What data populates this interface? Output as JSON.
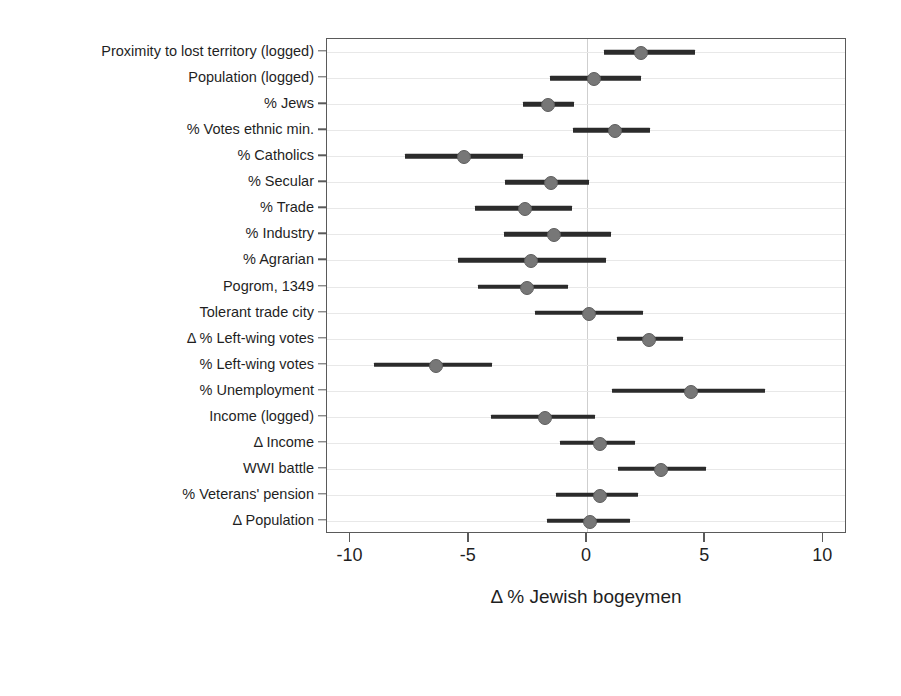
{
  "chart_data": {
    "type": "scatter",
    "subtype": "coefficient-forest-plot",
    "title": "",
    "xlabel": "Δ % Jewish bogeymen",
    "ylabel": "",
    "xlim": [
      -11,
      11
    ],
    "xticks": [
      -10,
      -5,
      0,
      5,
      10
    ],
    "xticklabels": [
      "-10",
      "-5",
      "0",
      "5",
      "10"
    ],
    "grid": "horizontal-light",
    "zero_reference_line": 0,
    "legend": "none",
    "point_color": "#777777",
    "bar_color": "#2b2b2b",
    "categories": [
      "Proximity to lost territory (logged)",
      "Population (logged)",
      "% Jews",
      "% Votes ethnic min.",
      "% Catholics",
      "% Secular",
      "% Trade",
      "% Industry",
      "% Agrarian",
      "Pogrom, 1349",
      "Tolerant trade city",
      "Δ % Left-wing votes",
      "% Left-wing votes",
      "% Unemployment",
      "Income (logged)",
      "Δ Income",
      "WWI battle",
      "% Veterans' pension",
      "Δ Population"
    ],
    "estimates": [
      2.25,
      0.25,
      -1.7,
      1.15,
      -5.25,
      -1.55,
      -2.65,
      -1.45,
      -2.4,
      -2.6,
      0.05,
      2.6,
      -6.45,
      4.35,
      -1.8,
      0.5,
      3.1,
      0.5,
      0.1
    ],
    "ci_low": [
      0.7,
      -1.55,
      -2.7,
      -0.6,
      -7.7,
      -3.45,
      -4.75,
      -3.5,
      -5.45,
      -4.6,
      -2.2,
      1.25,
      -9.0,
      1.05,
      -4.05,
      -1.15,
      1.3,
      -1.3,
      -1.7
    ],
    "ci_high": [
      4.55,
      2.3,
      -0.55,
      2.65,
      -2.7,
      0.1,
      -0.65,
      1.0,
      0.8,
      -0.8,
      2.35,
      4.05,
      -4.0,
      7.55,
      0.35,
      2.05,
      5.05,
      2.15,
      1.8
    ]
  }
}
